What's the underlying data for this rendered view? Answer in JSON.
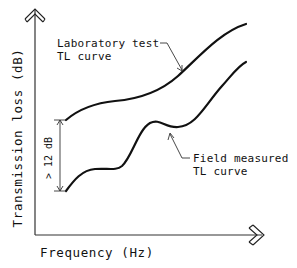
{
  "diagram": {
    "type": "transmission-loss-comparison",
    "axes": {
      "x_label": "Frequency (Hz)",
      "y_label": "Transmission loss (dB)"
    },
    "curves": [
      {
        "name": "Laboratory test TL curve",
        "label_line1": "Laboratory test",
        "label_line2": "TL curve"
      },
      {
        "name": "Field measured TL curve",
        "label_line1": "Field measured",
        "label_line2": "TL curve"
      }
    ],
    "dimension": {
      "label": "> 12 dB",
      "meaning": "difference between laboratory and field curves at low frequency"
    },
    "colors": {
      "ink": "#111111",
      "background": "#ffffff"
    }
  }
}
